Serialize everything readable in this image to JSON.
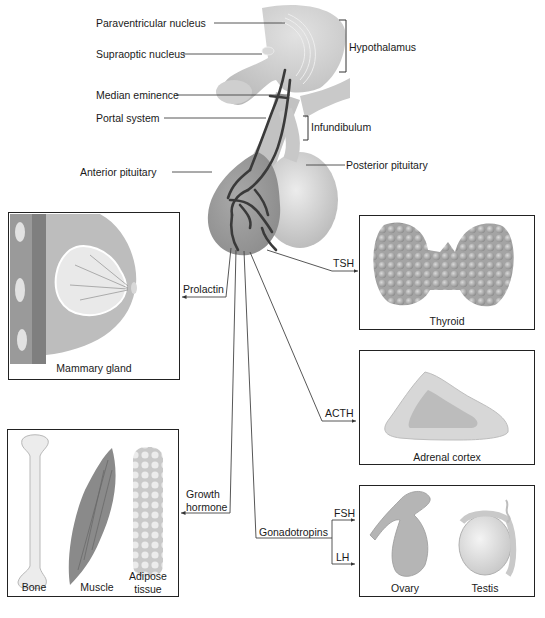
{
  "figure": {
    "brain_labels": {
      "paraventricular": "Paraventricular nucleus",
      "supraoptic": "Supraoptic nucleus",
      "median_eminence": "Median eminence",
      "portal_system": "Portal system",
      "anterior_pituitary": "Anterior pituitary",
      "hypothalamus": "Hypothalamus",
      "infundibulum": "Infundibulum",
      "posterior_pituitary": "Posterior pituitary"
    },
    "hormones": {
      "prolactin": "Prolactin",
      "tsh": "TSH",
      "acth": "ACTH",
      "growth_hormone_line1": "Growth",
      "growth_hormone_line2": "hormone",
      "gonadotropins": "Gonadotropins",
      "fsh": "FSH",
      "lh": "LH"
    },
    "targets": {
      "mammary": "Mammary gland",
      "thyroid": "Thyroid",
      "adrenal": "Adrenal cortex",
      "bone": "Bone",
      "muscle": "Muscle",
      "adipose_line1": "Adipose",
      "adipose_line2": "tissue",
      "ovary": "Ovary",
      "testis": "Testis"
    }
  }
}
